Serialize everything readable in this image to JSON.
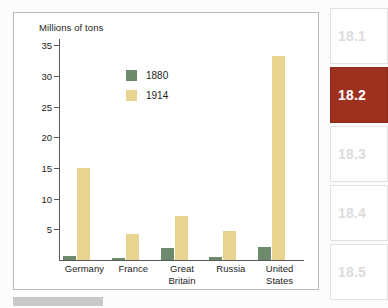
{
  "chart": {
    "axis_title": "Millions of tons",
    "legend": [
      {
        "label": "1880",
        "color": "#6d8a6c"
      },
      {
        "label": "1914",
        "color": "#e9d391"
      }
    ]
  },
  "chart_data": {
    "type": "bar",
    "title": "",
    "subtitle": "",
    "xlabel": "",
    "ylabel": "Millions of tons",
    "ylim": [
      0,
      36
    ],
    "yticks": [
      5,
      10,
      15,
      20,
      25,
      30,
      35
    ],
    "grid": false,
    "legend_position": "inside-top-left",
    "categories": [
      "Germany",
      "France",
      "Great Britain",
      "Russia",
      "United States"
    ],
    "category_lines": [
      [
        "Germany"
      ],
      [
        "France"
      ],
      [
        "Great",
        "Britain"
      ],
      [
        "Russia"
      ],
      [
        "United",
        "States"
      ]
    ],
    "series": [
      {
        "name": "1880",
        "color": "#6d8a6c",
        "values": [
          0.6,
          0.4,
          2.0,
          0.5,
          2.1
        ]
      },
      {
        "name": "1914",
        "color": "#e9d391",
        "values": [
          15.0,
          4.2,
          7.2,
          4.7,
          33.2
        ]
      }
    ]
  },
  "tabs": [
    {
      "label": "18.1",
      "active": false
    },
    {
      "label": "18.2",
      "active": true
    },
    {
      "label": "18.3",
      "active": false
    },
    {
      "label": "18.4",
      "active": false
    },
    {
      "label": "18.5",
      "active": false
    }
  ]
}
